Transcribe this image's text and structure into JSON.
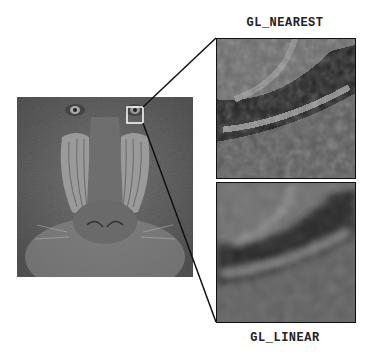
{
  "figure": {
    "top_label": "GL_NEAREST",
    "bottom_label": "GL_LINEAR",
    "source_image": "mandrill-photo",
    "highlight_region": {
      "description": "small white square over the mandrill's left eye region"
    },
    "colors": {
      "background": "#ffffff",
      "line": "#111111",
      "highlight_box": "#ffffff",
      "image_tone": "#6c6c6c"
    }
  }
}
